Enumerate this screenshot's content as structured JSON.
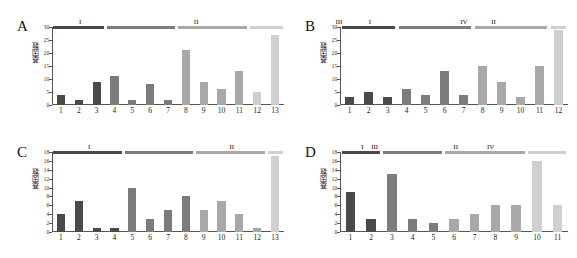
{
  "figure": {
    "panels": [
      "A",
      "B",
      "C",
      "D"
    ],
    "ylabel": "基因数",
    "group_labels": [
      "I",
      "II",
      "III",
      "IV"
    ],
    "group_colors": [
      "#4a4a4a",
      "#7c7c7c",
      "#a8a8a8",
      "#cfcfcf"
    ]
  },
  "chart_data": [
    {
      "type": "bar",
      "panel": "A",
      "title": "A",
      "xlabel": "",
      "ylabel": "基因数",
      "ylim": [
        0,
        30
      ],
      "yticks": [
        0,
        5,
        10,
        15,
        20,
        25,
        30
      ],
      "grid": false,
      "legend": "none",
      "categories": [
        "1",
        "2",
        "3",
        "4",
        "5",
        "6",
        "7",
        "8",
        "9",
        "10",
        "11",
        "12",
        "13"
      ],
      "values": [
        4,
        2,
        9,
        11,
        2,
        8,
        2,
        21,
        9,
        6,
        13,
        5,
        27
      ],
      "groups": [
        {
          "label": "I",
          "from": 1,
          "to": 3,
          "color": "#4a4a4a"
        },
        {
          "label": "II",
          "from": 4,
          "to": 7,
          "color": "#7c7c7c"
        },
        {
          "label": "III",
          "from": 8,
          "to": 11,
          "color": "#a8a8a8"
        },
        {
          "label": "IV",
          "from": 12,
          "to": 13,
          "color": "#cfcfcf"
        }
      ]
    },
    {
      "type": "bar",
      "panel": "B",
      "title": "B",
      "xlabel": "",
      "ylabel": "基因数",
      "ylim": [
        0,
        30
      ],
      "yticks": [
        0,
        5,
        10,
        15,
        20,
        25,
        30
      ],
      "grid": false,
      "legend": "none",
      "categories": [
        "1",
        "2",
        "3",
        "4",
        "5",
        "6",
        "7",
        "8",
        "9",
        "10",
        "11",
        "12"
      ],
      "values": [
        3,
        5,
        3,
        6,
        4,
        13,
        4,
        15,
        9,
        3,
        15,
        29
      ],
      "groups": [
        {
          "label": "I",
          "from": 1,
          "to": 3,
          "color": "#4a4a4a"
        },
        {
          "label": "II",
          "from": 4,
          "to": 7,
          "color": "#7c7c7c"
        },
        {
          "label": "III",
          "from": 8,
          "to": 11,
          "color": "#a8a8a8"
        },
        {
          "label": "IV",
          "from": 12,
          "to": 12,
          "color": "#cfcfcf"
        }
      ]
    },
    {
      "type": "bar",
      "panel": "C",
      "title": "C",
      "xlabel": "",
      "ylabel": "基因数",
      "ylim": [
        0,
        18
      ],
      "yticks": [
        0,
        2,
        4,
        6,
        8,
        10,
        12,
        14,
        16,
        18
      ],
      "grid": false,
      "legend": "none",
      "categories": [
        "1",
        "2",
        "3",
        "4",
        "5",
        "6",
        "7",
        "8",
        "9",
        "10",
        "11",
        "12",
        "13"
      ],
      "values": [
        4,
        7,
        1,
        1,
        10,
        3,
        5,
        8,
        5,
        7,
        4,
        1,
        17
      ],
      "groups": [
        {
          "label": "I",
          "from": 1,
          "to": 4,
          "color": "#4a4a4a"
        },
        {
          "label": "II",
          "from": 5,
          "to": 8,
          "color": "#7c7c7c"
        },
        {
          "label": "III",
          "from": 9,
          "to": 12,
          "color": "#a8a8a8"
        },
        {
          "label": "IV",
          "from": 13,
          "to": 13,
          "color": "#cfcfcf"
        }
      ]
    },
    {
      "type": "bar",
      "panel": "D",
      "title": "D",
      "xlabel": "",
      "ylabel": "基因数",
      "ylim": [
        0,
        18
      ],
      "yticks": [
        0,
        2,
        4,
        6,
        8,
        10,
        12,
        14,
        16,
        18
      ],
      "grid": false,
      "legend": "none",
      "categories": [
        "1",
        "2",
        "3",
        "4",
        "5",
        "6",
        "7",
        "8",
        "9",
        "10",
        "11"
      ],
      "values": [
        9,
        3,
        13,
        3,
        2,
        3,
        4,
        6,
        6,
        16,
        6
      ],
      "groups": [
        {
          "label": "I",
          "from": 1,
          "to": 2,
          "color": "#4a4a4a"
        },
        {
          "label": "II",
          "from": 3,
          "to": 5,
          "color": "#7c7c7c"
        },
        {
          "label": "III",
          "from": 6,
          "to": 9,
          "color": "#a8a8a8"
        },
        {
          "label": "IV",
          "from": 10,
          "to": 11,
          "color": "#cfcfcf"
        }
      ]
    }
  ]
}
